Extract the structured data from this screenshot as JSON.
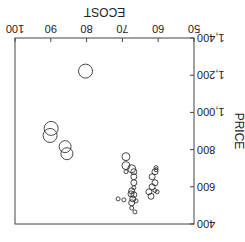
{
  "chart_data": {
    "type": "scatter",
    "subtype": "bubble",
    "orientation_note": "image rendered rotated 180 degrees",
    "title": "",
    "xlabel": "ECOST",
    "ylabel": "PRICE",
    "xlim": [
      50,
      100
    ],
    "ylim": [
      400,
      1400
    ],
    "xticks": [
      "50",
      "60",
      "70",
      "80",
      "90",
      "100"
    ],
    "yticks": [
      "400",
      "600",
      "800",
      "1,000",
      "1,200",
      "1,400"
    ],
    "grid": false,
    "points": [
      {
        "x": 62.0,
        "y": 549,
        "r": 3
      },
      {
        "x": 60.9,
        "y": 580,
        "r": 2
      },
      {
        "x": 62.6,
        "y": 573,
        "r": 3
      },
      {
        "x": 61.7,
        "y": 600,
        "r": 3
      },
      {
        "x": 60.3,
        "y": 573,
        "r": 2
      },
      {
        "x": 60.9,
        "y": 622,
        "r": 3
      },
      {
        "x": 61.7,
        "y": 654,
        "r": 3
      },
      {
        "x": 60.9,
        "y": 681,
        "r": 3
      },
      {
        "x": 60.6,
        "y": 692,
        "r": 2
      },
      {
        "x": 60.6,
        "y": 703,
        "r": 2
      },
      {
        "x": 67.4,
        "y": 486,
        "r": 2
      },
      {
        "x": 66.5,
        "y": 465,
        "r": 2
      },
      {
        "x": 67.4,
        "y": 514,
        "r": 3
      },
      {
        "x": 67.1,
        "y": 535,
        "r": 3
      },
      {
        "x": 66.8,
        "y": 557,
        "r": 3
      },
      {
        "x": 66.2,
        "y": 524,
        "r": 2
      },
      {
        "x": 67.6,
        "y": 562,
        "r": 3
      },
      {
        "x": 67.4,
        "y": 578,
        "r": 3
      },
      {
        "x": 66.8,
        "y": 595,
        "r": 2
      },
      {
        "x": 66.8,
        "y": 622,
        "r": 3
      },
      {
        "x": 66.8,
        "y": 654,
        "r": 3
      },
      {
        "x": 66.8,
        "y": 681,
        "r": 3
      },
      {
        "x": 69.6,
        "y": 530,
        "r": 2
      },
      {
        "x": 71.2,
        "y": 535,
        "r": 2
      },
      {
        "x": 69.0,
        "y": 681,
        "r": 2
      },
      {
        "x": 69.0,
        "y": 714,
        "r": 4
      },
      {
        "x": 69.0,
        "y": 762,
        "r": 4
      },
      {
        "x": 67.4,
        "y": 697,
        "r": 4
      },
      {
        "x": 85.5,
        "y": 778,
        "r": 6
      },
      {
        "x": 86.0,
        "y": 816,
        "r": 6
      },
      {
        "x": 90.2,
        "y": 876,
        "r": 7
      },
      {
        "x": 89.9,
        "y": 914,
        "r": 7
      },
      {
        "x": 80.3,
        "y": 1222,
        "r": 7
      }
    ]
  }
}
